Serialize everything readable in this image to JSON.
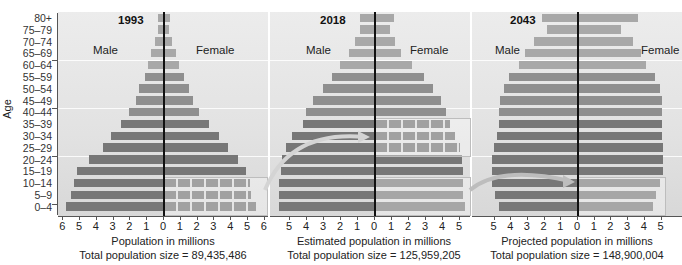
{
  "chart_data": {
    "type": "bar",
    "subtype": "population-pyramid",
    "ylabel": "Age",
    "categories": [
      "80+",
      "75–79",
      "70–74",
      "65–69",
      "60–64",
      "55–59",
      "50–54",
      "45–49",
      "40–44",
      "35–39",
      "30–34",
      "25–29",
      "20–24",
      "15–19",
      "10–14",
      "5–9",
      "0–4"
    ],
    "panels": [
      {
        "title": "1993",
        "xlabel": "Population in millions",
        "total": "Total population size = 89,435,486",
        "xticks_left": [
          "6",
          "5",
          "4",
          "3",
          "2",
          "1",
          "0"
        ],
        "xticks_right": [
          "1",
          "2",
          "3",
          "4",
          "5",
          "6"
        ],
        "xlim": [
          -6,
          6
        ],
        "series": [
          {
            "name": "Male",
            "values": [
              0.3,
              0.3,
              0.5,
              0.7,
              0.9,
              1.1,
              1.4,
              1.6,
              2.0,
              2.5,
              3.1,
              3.6,
              4.4,
              5.1,
              5.3,
              5.5,
              5.8
            ]
          },
          {
            "name": "Female",
            "values": [
              0.35,
              0.3,
              0.5,
              0.7,
              0.9,
              1.2,
              1.5,
              1.7,
              2.1,
              2.7,
              3.3,
              3.8,
              4.4,
              4.9,
              5.1,
              5.2,
              5.5
            ]
          }
        ],
        "highlighted_groups": [
          "10–14",
          "5–9",
          "0–4"
        ]
      },
      {
        "title": "2018",
        "xlabel": "Estimated population in millions",
        "total": "Total population size = 125,959,205",
        "xticks_left": [
          "5",
          "4",
          "3",
          "2",
          "1",
          "0"
        ],
        "xticks_right": [
          "1",
          "2",
          "3",
          "4",
          "5"
        ],
        "xlim": [
          -6,
          6
        ],
        "series": [
          {
            "name": "Male",
            "values": [
              0.8,
              0.8,
              1.1,
              1.5,
              2.0,
              2.5,
              3.0,
              3.6,
              4.0,
              4.2,
              4.8,
              5.2,
              5.4,
              5.5,
              5.6,
              5.6,
              5.6
            ]
          },
          {
            "name": "Female",
            "values": [
              1.1,
              0.9,
              1.2,
              1.5,
              2.2,
              2.9,
              3.4,
              3.9,
              4.2,
              4.4,
              4.7,
              5.0,
              5.1,
              5.2,
              5.2,
              5.2,
              5.3
            ]
          }
        ],
        "highlighted_groups": [
          "35–39",
          "30–34",
          "25–29",
          "10–14",
          "5–9",
          "0–4"
        ]
      },
      {
        "title": "2043",
        "xlabel": "Projected population in millions",
        "total": "Total population size = 148,900,004",
        "xticks_left": [
          "5",
          "4",
          "3",
          "2",
          "1",
          "0"
        ],
        "xticks_right": [
          "1",
          "2",
          "3",
          "4",
          "5"
        ],
        "xlim": [
          -5.5,
          5.5
        ],
        "series": [
          {
            "name": "Male",
            "values": [
              2.1,
              1.8,
              2.6,
              3.1,
              3.5,
              4.1,
              4.4,
              4.6,
              4.7,
              4.7,
              4.8,
              5.0,
              5.1,
              5.1,
              5.1,
              4.9,
              4.7
            ]
          },
          {
            "name": "Female",
            "values": [
              3.6,
              2.6,
              3.3,
              3.8,
              4.1,
              4.6,
              4.9,
              5.0,
              5.0,
              5.0,
              5.0,
              5.1,
              5.1,
              5.1,
              4.9,
              4.7,
              4.5
            ]
          }
        ],
        "highlighted_groups": [
          "10–14",
          "5–9",
          "0–4"
        ]
      }
    ],
    "legend": [
      "Male",
      "Female"
    ],
    "grid": true
  },
  "labels": {
    "age": "Age",
    "male": "Male",
    "female": "Female"
  }
}
